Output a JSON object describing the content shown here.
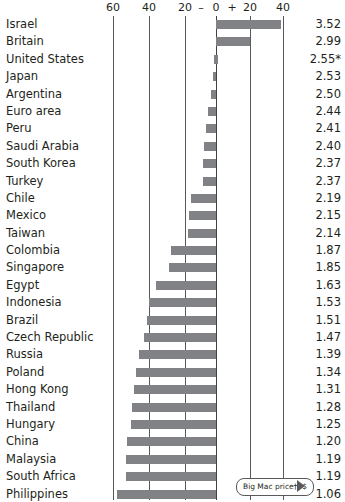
{
  "chart_data": {
    "type": "bar",
    "orientation": "horizontal",
    "title": "",
    "subtitle": "",
    "xlabel": "",
    "ylabel": "",
    "xlim": [
      -68,
      48
    ],
    "grid": true,
    "legend_position": "none",
    "axis": {
      "tick_labels": [
        "60",
        "40",
        "20",
        "0",
        "20",
        "40"
      ],
      "tick_values": [
        -60,
        -40,
        -20,
        0,
        20,
        40
      ],
      "minus_sign": "–",
      "plus_sign": "+"
    },
    "annotation": {
      "text": "Big Mac price†, $",
      "points_to": "price-column"
    },
    "categories": [
      "Israel",
      "Britain",
      "United States",
      "Japan",
      "Argentina",
      "Euro area",
      "Peru",
      "Saudi Arabia",
      "South Korea",
      "Turkey",
      "Chile",
      "Mexico",
      "Taiwan",
      "Colombia",
      "Singapore",
      "Egypt",
      "Indonesia",
      "Brazil",
      "Czech Republic",
      "Russia",
      "Poland",
      "Hong Kong",
      "Thailand",
      "Hungary",
      "China",
      "Malaysia",
      "South Africa",
      "Philippines"
    ],
    "series": [
      {
        "name": "Under/overvaluation against the dollar, %",
        "values": [
          39,
          20,
          0,
          -2,
          -3,
          -5,
          -6,
          -7,
          -8,
          -8,
          -15,
          -16,
          -17,
          -27,
          -28,
          -36,
          -40,
          -41,
          -43,
          -46,
          -48,
          -49,
          -50,
          -51,
          -53,
          -54,
          -54,
          -59
        ]
      }
    ],
    "price_column": {
      "header": "Big Mac price†, $",
      "values": [
        "3.52",
        "2.99",
        "2.55*",
        "2.53",
        "2.50",
        "2.44",
        "2.41",
        "2.40",
        "2.37",
        "2.37",
        "2.19",
        "2.15",
        "2.14",
        "1.87",
        "1.85",
        "1.63",
        "1.53",
        "1.51",
        "1.47",
        "1.39",
        "1.34",
        "1.31",
        "1.28",
        "1.25",
        "1.20",
        "1.19",
        "1.19",
        "1.06"
      ]
    },
    "colors": {
      "bar": "#808285",
      "gridline": "#58595b",
      "text": "#231f20",
      "background": "#ffffff"
    }
  }
}
